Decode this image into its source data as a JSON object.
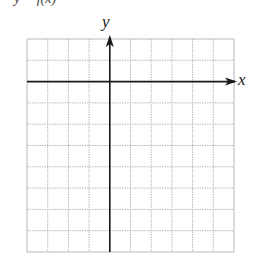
{
  "figure": {
    "caption_cropped": "y = f(x)",
    "x_axis_label": "x",
    "y_axis_label": "y",
    "grid": {
      "columns": 10,
      "rows": 10,
      "left": 27,
      "top": 39,
      "right": 234,
      "bottom": 252,
      "line_style": "dotted",
      "line_color": "#b8b8b8",
      "border_color": "#bdbdbd"
    },
    "axes": {
      "y_axis_column": 4,
      "x_axis_row": 2,
      "color": "#1a1a1a"
    }
  }
}
